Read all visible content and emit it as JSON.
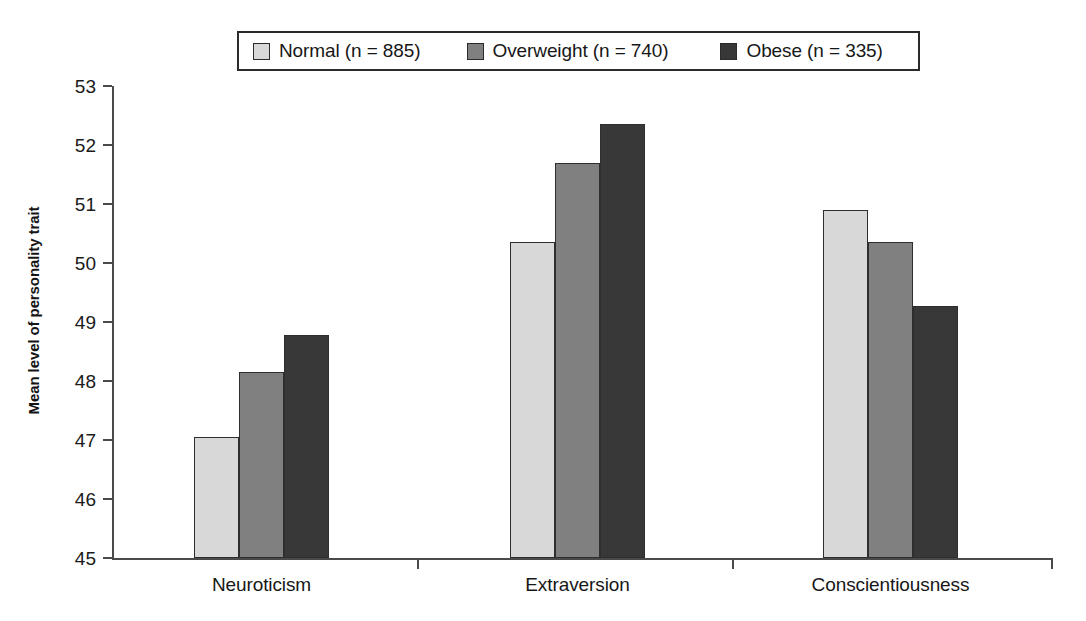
{
  "chart_data": {
    "type": "bar",
    "title": "",
    "subtitle": "",
    "xlabel": "",
    "ylabel": "Mean level of personality trait",
    "categories": [
      "Neuroticism",
      "Extraversion",
      "Conscientiousness"
    ],
    "ylim": [
      45,
      53
    ],
    "ytick_labels": [
      "45",
      "46",
      "47",
      "48",
      "49",
      "50",
      "51",
      "52",
      "53"
    ],
    "ytick_values": [
      45,
      46,
      47,
      48,
      49,
      50,
      51,
      52,
      53
    ],
    "grid": false,
    "legend_position": "top-center",
    "series": [
      {
        "name": "Normal (n = 885)",
        "group": "Normal",
        "n": 885,
        "color": "#d8d8d8",
        "values": [
          47.05,
          50.35,
          50.9
        ]
      },
      {
        "name": "Overweight (n = 740)",
        "group": "Overweight",
        "n": 740,
        "color": "#808080",
        "values": [
          48.15,
          51.7,
          50.35
        ]
      },
      {
        "name": "Obese (n = 335)",
        "group": "Obese",
        "n": 335,
        "color": "#383838",
        "values": [
          48.78,
          52.35,
          49.27
        ]
      }
    ]
  },
  "legend": {
    "entries": [
      {
        "label": "Normal (n = 885)",
        "swatch_name": "legend-swatch-normal",
        "color": "#d8d8d8"
      },
      {
        "label": "Overweight (n = 740)",
        "swatch_name": "legend-swatch-overweight",
        "color": "#808080"
      },
      {
        "label": "Obese (n = 335)",
        "swatch_name": "legend-swatch-obese",
        "color": "#383838"
      }
    ]
  }
}
